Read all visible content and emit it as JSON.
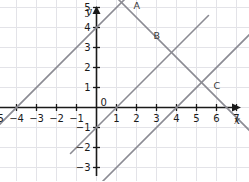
{
  "figure": {
    "title": "",
    "background_color": "#ffffff",
    "grid_color": "#e3e3e8",
    "axis_color": "#1a1a1a",
    "line_color": "#8c8c94",
    "label_color": "#1a1a1a"
  },
  "axes": {
    "x_axis_name": "x",
    "y_axis_name": "y",
    "origin_label": "0",
    "x_ticks": [
      "-5",
      "-4",
      "-3",
      "-2",
      "-1",
      "1",
      "2",
      "3",
      "4",
      "5",
      "6",
      "7",
      "8"
    ],
    "y_ticks": [
      "5",
      "4",
      "3",
      "2",
      "1",
      "-1",
      "-2",
      "-3",
      "-4"
    ],
    "x_range": [
      -5.7,
      8.8
    ],
    "y_range": [
      -4.6,
      5.9
    ],
    "unit_px": 20,
    "grid": true
  },
  "chart_data": {
    "type": "line",
    "title": "",
    "xlabel": "x",
    "ylabel": "y",
    "xlim": [
      -5.7,
      8.8
    ],
    "ylim": [
      -4.6,
      5.9
    ],
    "grid": true,
    "legend": "none",
    "series": [
      {
        "name": "line-1",
        "slope": 1,
        "intercept": 4,
        "x_intercept": -4,
        "x_start": -5.6,
        "x_end": 1.6,
        "color": "#8c8c94"
      },
      {
        "name": "line-2",
        "slope": 1,
        "intercept": -4,
        "x_intercept": 4,
        "x_start": -5.6,
        "x_end": 8.6,
        "color": "#8c8c94"
      },
      {
        "name": "line-3",
        "slope": 1,
        "intercept": -1,
        "x_intercept": 1,
        "x_start": -1.3,
        "x_end": 5.6,
        "color": "#8c8c94"
      },
      {
        "name": "line-4",
        "slope": -1,
        "intercept": 6.5,
        "x_intercept": 6.5,
        "x_start": 0.3,
        "x_end": 8.6,
        "color": "#8c8c94"
      }
    ],
    "points": [
      {
        "label": "A",
        "x": 1.5,
        "y": 5
      },
      {
        "label": "B",
        "x": 2.5,
        "y": 3.5
      },
      {
        "label": "C",
        "x": 5.5,
        "y": 1
      }
    ]
  }
}
